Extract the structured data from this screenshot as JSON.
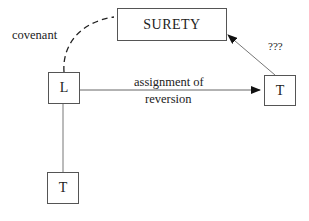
{
  "nodes": {
    "surety": "SURETY",
    "landlord": "L",
    "tenant_right": "T",
    "tenant_bottom": "T"
  },
  "edges": {
    "covenant": "covenant",
    "assignment_line1": "assignment of",
    "assignment_line2": "reversion",
    "unknown": "???"
  },
  "colors": {
    "line": "#555555",
    "text": "#222222"
  }
}
